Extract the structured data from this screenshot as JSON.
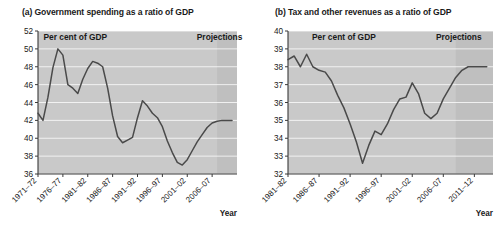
{
  "figure": {
    "panels": [
      {
        "id": "panel-a",
        "title": "(a) Government spending as a ratio of GDP",
        "annotation_units": "Per cent of GDP",
        "annotation_projections": "Projections",
        "axis_name_x": "Year"
      },
      {
        "id": "panel-b",
        "title": "(b) Tax and other revenues as a ratio of GDP",
        "annotation_units": "Per cent of GDP",
        "annotation_projections": "Projections",
        "axis_name_x": "Year"
      }
    ]
  },
  "chart_data": [
    {
      "type": "line",
      "title": "(a) Government spending as a ratio of GDP",
      "xlabel": "Year",
      "ylabel": "Per cent of GDP",
      "ylim": [
        36,
        52
      ],
      "ytick_labels": [
        "52",
        "50",
        "48",
        "46",
        "44",
        "42",
        "40",
        "38",
        "36"
      ],
      "yticks": [
        52,
        50,
        48,
        46,
        44,
        42,
        40,
        38,
        36
      ],
      "xtick_labels": [
        "1971–72",
        "1976–77",
        "1981–82",
        "1986–87",
        "1991–92",
        "1996–97",
        "2001–02",
        "2006–07"
      ],
      "xticks": [
        1971,
        1976,
        1981,
        1986,
        1991,
        1996,
        2001,
        2006
      ],
      "xlim": [
        1971,
        2011
      ],
      "grid": true,
      "legend": "none",
      "annotations": [
        {
          "text": "Per cent of GDP",
          "x": 1978.5,
          "y": 51.0
        },
        {
          "text": "Projections",
          "x": 2007.5,
          "y": 51.0
        }
      ],
      "projection_start": 2007,
      "x": [
        1971,
        1972,
        1973,
        1974,
        1975,
        1976,
        1977,
        1978,
        1979,
        1980,
        1981,
        1982,
        1983,
        1984,
        1985,
        1986,
        1987,
        1988,
        1989,
        1990,
        1991,
        1992,
        1993,
        1994,
        1995,
        1996,
        1997,
        1998,
        1999,
        2000,
        2001,
        2002,
        2003,
        2004,
        2005,
        2006,
        2007,
        2008,
        2009,
        2010
      ],
      "values": [
        42.8,
        42.0,
        44.6,
        47.9,
        50.0,
        49.3,
        46.0,
        45.6,
        45.0,
        46.6,
        47.8,
        48.6,
        48.4,
        48.0,
        45.6,
        42.5,
        40.2,
        39.5,
        39.8,
        40.1,
        42.3,
        44.2,
        43.6,
        42.8,
        42.3,
        41.3,
        39.7,
        38.4,
        37.3,
        37.0,
        37.6,
        38.6,
        39.6,
        40.4,
        41.2,
        41.7,
        41.9,
        42.0,
        42.0,
        42.0
      ]
    },
    {
      "type": "line",
      "title": "(b) Tax and other revenues as a ratio of GDP",
      "xlabel": "Year",
      "ylabel": "Per cent of GDP",
      "ylim": [
        32,
        40
      ],
      "ytick_labels": [
        "40",
        "39",
        "38",
        "37",
        "36",
        "35",
        "34",
        "33",
        "32"
      ],
      "yticks": [
        40,
        39,
        38,
        37,
        36,
        35,
        34,
        33,
        32
      ],
      "xtick_labels": [
        "1981–82",
        "1986–87",
        "1991–92",
        "1996–97",
        "2001–02",
        "2006–07",
        "2011–12"
      ],
      "xticks": [
        1981,
        1986,
        1991,
        1996,
        2001,
        2006,
        2011
      ],
      "xlim": [
        1981,
        2014
      ],
      "grid": true,
      "legend": "none",
      "annotations": [
        {
          "text": "Per cent of GDP",
          "x": 1990.0,
          "y": 39.5
        },
        {
          "text": "Projections",
          "x": 2008.5,
          "y": 39.5
        }
      ],
      "projection_start": 2008,
      "x": [
        1981,
        1982,
        1983,
        1984,
        1985,
        1986,
        1987,
        1988,
        1989,
        1990,
        1991,
        1992,
        1993,
        1994,
        1995,
        1996,
        1997,
        1998,
        1999,
        2000,
        2001,
        2002,
        2003,
        2004,
        2005,
        2006,
        2007,
        2008,
        2009,
        2010,
        2011,
        2012,
        2013
      ],
      "values": [
        38.4,
        38.6,
        38.0,
        38.7,
        38.0,
        37.8,
        37.7,
        37.2,
        36.4,
        35.7,
        34.8,
        33.8,
        32.6,
        33.6,
        34.4,
        34.2,
        34.8,
        35.6,
        36.2,
        36.3,
        37.1,
        36.5,
        35.4,
        35.1,
        35.4,
        36.2,
        36.8,
        37.4,
        37.8,
        38.0,
        38.0,
        38.0,
        38.0
      ]
    }
  ]
}
